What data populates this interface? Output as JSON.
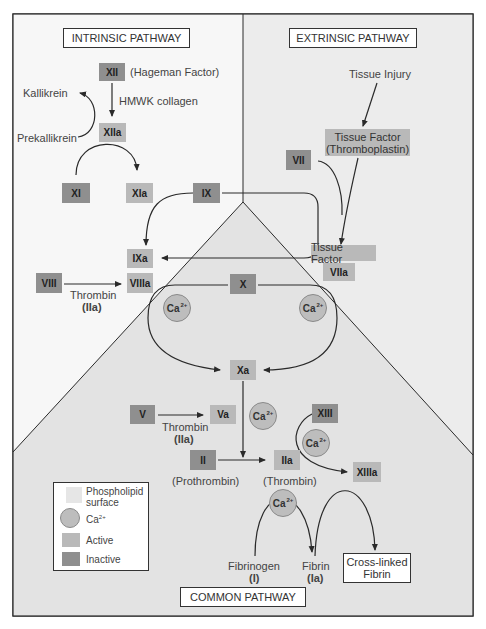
{
  "sections": {
    "intrinsic": "INTRINSIC PATHWAY",
    "extrinsic": "EXTRINSIC PATHWAY",
    "common": "COMMON PATHWAY"
  },
  "intrinsic": {
    "xii": "XII",
    "xii_name": "(Hageman Factor)",
    "cofactor_xii": "HMWK collagen",
    "kallikrein": "Kallikrein",
    "prekallikrein": "Prekallikrein",
    "xiia": "XIIa",
    "xi": "XI",
    "xia": "XIa",
    "ix": "IX",
    "ixa": "IXa",
    "viii": "VIII",
    "viiia": "VIIIa",
    "thrombin": "Thrombin",
    "thrombin_code": "(IIa)"
  },
  "extrinsic": {
    "tissue_injury": "Tissue Injury",
    "tissue_factor_line1": "Tissue Factor",
    "tissue_factor_line2": "(Thromboplastin)",
    "vii": "VII",
    "tissue_factor_label": "Tissue Factor",
    "viia": "VIIa"
  },
  "common": {
    "x": "X",
    "xa": "Xa",
    "v": "V",
    "va": "Va",
    "thrombin": "Thrombin",
    "thrombin_code": "(IIa)",
    "ii": "II",
    "ii_name": "(Prothrombin)",
    "iia": "IIa",
    "iia_name": "(Thrombin)",
    "xiii": "XIII",
    "xiiia": "XIIIa",
    "fibrinogen": "Fibrinogen",
    "fibrinogen_code": "(I)",
    "fibrin": "Fibrin",
    "fibrin_code": "(Ia)",
    "crosslinked_line1": "Cross-linked",
    "crosslinked_line2": "Fibrin"
  },
  "calcium": {
    "base": "Ca",
    "charge": "2+"
  },
  "legend": {
    "phospholipid_line1": "Phospholipid",
    "phospholipid_line2": "surface",
    "calcium": "Ca",
    "calcium_charge": "2+",
    "active": "Active",
    "inactive": "Inactive"
  },
  "colors": {
    "inactive": "#8f8f8f",
    "active": "#b9b9b9",
    "calcium": "#bdbdbd",
    "phospholipid": "#e4e4e4",
    "background_upper": "#f3f3f3",
    "background_right": "#ebebeb",
    "line": "#2a2a2a"
  }
}
